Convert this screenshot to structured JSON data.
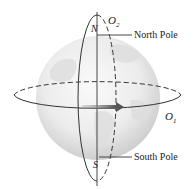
{
  "diagram": {
    "labels": {
      "north_letter": "N",
      "south_letter": "S",
      "orbit2": "O",
      "orbit2_sub": "2",
      "orbit1": "O",
      "orbit1_sub": "1",
      "north_pole": "North Pole",
      "south_pole": "South Pole"
    },
    "colors": {
      "globe_light": "#f4f4f4",
      "globe_dark": "#cfcfcf",
      "line": "#333333",
      "arrow": "#6a6a6a"
    }
  }
}
